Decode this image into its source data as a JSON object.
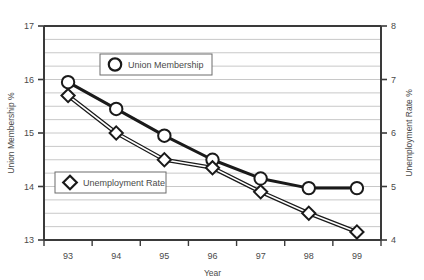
{
  "chart_data": {
    "type": "line",
    "title": "",
    "xlabel": "Year",
    "categories": [
      "93",
      "94",
      "95",
      "96",
      "97",
      "98",
      "99"
    ],
    "grid": true,
    "grid_interval": 0.25,
    "legend_position": "inside",
    "axes": {
      "left": {
        "label": "Union Membership %",
        "ylim": [
          13,
          17
        ],
        "ticks": [
          "13",
          "14",
          "15",
          "16",
          "17"
        ],
        "tick_values": [
          13,
          14,
          15,
          16,
          17
        ]
      },
      "right": {
        "label": "Unemployment Rate %",
        "ylim": [
          4,
          8
        ],
        "ticks": [
          "4",
          "5",
          "6",
          "7",
          "8"
        ],
        "tick_values": [
          4,
          5,
          6,
          7,
          8
        ]
      }
    },
    "series": [
      {
        "name": "Union Membership",
        "axis": "left",
        "marker": "circle",
        "color": "#1a1a1a",
        "values": [
          15.95,
          15.45,
          14.95,
          14.5,
          14.15,
          13.97,
          13.97
        ]
      },
      {
        "name": "Unemployment Rate",
        "axis": "right",
        "marker": "diamond",
        "color": "#1a1a1a",
        "values": [
          6.7,
          6.0,
          5.5,
          5.35,
          4.9,
          4.5,
          4.15
        ]
      }
    ]
  },
  "legend": {
    "items": [
      {
        "label": "Union Membership",
        "marker": "circle"
      },
      {
        "label": "Unemployment Rate",
        "marker": "diamond"
      }
    ]
  },
  "colors": {
    "line": "#1a1a1a",
    "grid": "#c8c8c8",
    "axis": "#3a3a3a",
    "text": "#4a4a4a",
    "background": "#ffffff"
  }
}
